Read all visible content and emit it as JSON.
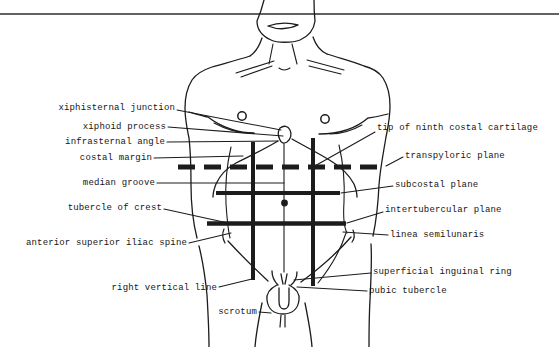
{
  "diagram": {
    "colors": {
      "ink": "#1c1c1c",
      "background": "#ffffff"
    },
    "labels_left": [
      {
        "text": "xiphisternal junction"
      },
      {
        "text": "xiphoid process"
      },
      {
        "text": "infrasternal angle"
      },
      {
        "text": "costal margin"
      },
      {
        "text": "median groove"
      },
      {
        "text": "tubercle of crest"
      },
      {
        "text": "anterior superior iliac spine"
      },
      {
        "text": "right vertical line"
      },
      {
        "text": "scrotum"
      }
    ],
    "labels_right": [
      {
        "text": "tip of ninth costal cartilage"
      },
      {
        "text": "transpyloric plane"
      },
      {
        "text": "subcostal plane"
      },
      {
        "text": "intertubercular plane"
      },
      {
        "text": "linea semilunaris"
      },
      {
        "text": "superficial inguinal ring"
      },
      {
        "text": "pubic tubercle"
      }
    ]
  }
}
